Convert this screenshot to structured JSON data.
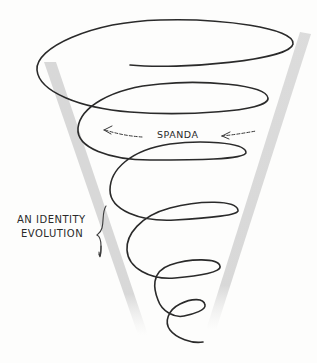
{
  "diagram": {
    "type": "cone-spiral",
    "labels": {
      "spanda": "SPANDA",
      "identity_line1": "AN IDENTITY",
      "identity_line2": "EVOLUTION"
    },
    "elements": {
      "cone": "two grey shaded strokes converging downward forming a funnel",
      "spiral": "hand-drawn helix descending and narrowing within the cone",
      "arrows": "two left-pointing dashed arrows flanking the SPANDA label",
      "brace": "curly bracket marking a span of the spiral, pointing to the identity label"
    },
    "colors": {
      "ink": "#2a2a2a",
      "cone_shade": "#cfcfcf",
      "background": "#fdfdfc"
    }
  }
}
